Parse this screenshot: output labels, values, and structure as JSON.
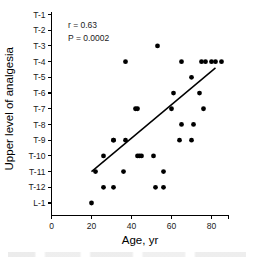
{
  "chart_data": {
    "type": "scatter",
    "title": "",
    "xlabel": "Age, yr",
    "ylabel": "Upper level of analgesia",
    "xlim": [
      0,
      90
    ],
    "ylim": [
      0,
      14
    ],
    "grid": false,
    "legend": null,
    "xticks": [
      0,
      20,
      40,
      60,
      80
    ],
    "xtick_labels": [
      "0",
      "20",
      "40",
      "60",
      "80"
    ],
    "ytick_labels": [
      "T-1",
      "T-2",
      "T-3",
      "T-4",
      "T-5",
      "T-6",
      "T-7",
      "T-8",
      "T-9",
      "T-10",
      "T-11",
      "T-12",
      "L-1"
    ],
    "y_level_index": [
      1,
      2,
      3,
      4,
      5,
      6,
      7,
      8,
      9,
      10,
      11,
      12,
      13
    ],
    "annotations": [
      {
        "name": "correlation",
        "text": "r = 0.63"
      },
      {
        "name": "p-value",
        "text": "P = 0.0002"
      }
    ],
    "fit_line": {
      "x_start": 20,
      "y_start": 11.0,
      "x_end": 82,
      "y_end": 4.4
    },
    "x": [
      20,
      22,
      26,
      26,
      31,
      31,
      31,
      36,
      37,
      37,
      42,
      43,
      43,
      44,
      45,
      51,
      52,
      53,
      56,
      56,
      60,
      61,
      64,
      65,
      65,
      70,
      70,
      71,
      74,
      75,
      76,
      77,
      80,
      82,
      85
    ],
    "y": [
      13,
      11,
      10,
      12,
      9,
      9,
      12,
      11,
      4,
      9,
      7,
      7,
      10,
      10,
      10,
      10,
      12,
      3,
      11,
      12,
      7,
      6,
      9,
      4,
      8,
      9,
      5,
      8,
      6,
      4,
      7,
      4,
      4,
      4,
      4
    ],
    "y_labels_per_point": [
      "L-1",
      "T-11",
      "T-10",
      "T-12",
      "T-9",
      "T-9",
      "T-12",
      "T-11",
      "T-4",
      "T-9",
      "T-7",
      "T-7",
      "T-10",
      "T-10",
      "T-10",
      "T-10",
      "T-12",
      "T-3",
      "T-11",
      "T-12",
      "T-7",
      "T-6",
      "T-9",
      "T-4",
      "T-8",
      "T-9",
      "T-5",
      "T-8",
      "T-6",
      "T-4",
      "T-7",
      "T-4",
      "T-4",
      "T-4",
      "T-4"
    ],
    "marker": {
      "shape": "circle",
      "color": "#000000",
      "size_px": 4.6
    }
  },
  "colors": {
    "background": "#ffffff",
    "axis": "#000000",
    "marker": "#000000",
    "fit_line": "#000000",
    "text": "#1a1a1a"
  }
}
